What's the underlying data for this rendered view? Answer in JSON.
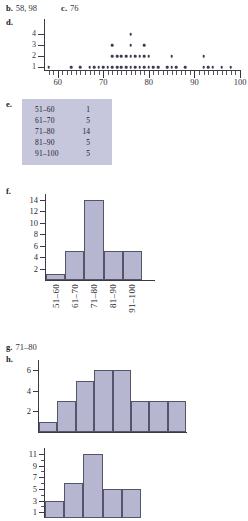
{
  "answers": {
    "b": {
      "label": "b.",
      "text": "58, 98"
    },
    "c": {
      "label": "c.",
      "text": "76"
    },
    "d": {
      "label": "d."
    },
    "e": {
      "label": "e."
    },
    "f": {
      "label": "f."
    },
    "g": {
      "label": "g.",
      "text": "71–80"
    },
    "h": {
      "label": "h."
    }
  },
  "frequency_table": {
    "rows": [
      {
        "interval": "51–60",
        "frequency": "1"
      },
      {
        "interval": "61–70",
        "frequency": "5"
      },
      {
        "interval": "71–80",
        "frequency": "14"
      },
      {
        "interval": "81–90",
        "frequency": "5"
      },
      {
        "interval": "91–100",
        "frequency": "5"
      }
    ],
    "background_color": "#c6c6dc"
  },
  "chart_data": [
    {
      "id": "dotplot_d",
      "type": "scatter",
      "title": "",
      "xlabel": "",
      "ylabel": "",
      "xlim": [
        57,
        100
      ],
      "ylim": [
        0,
        4
      ],
      "xtick_labels": [
        "60",
        "70",
        "80",
        "90",
        "100"
      ],
      "xticks": [
        60,
        70,
        80,
        90,
        100
      ],
      "ytick_labels": [
        "1",
        "2",
        "3",
        "4"
      ],
      "yticks": [
        1,
        2,
        3,
        4
      ],
      "grid": false,
      "note": "Dot plot: each dot is one observation stacked at its value",
      "x": [
        58,
        63,
        65,
        67,
        68,
        69,
        70,
        71,
        72,
        73,
        74,
        75,
        76,
        77,
        78,
        79,
        80,
        81,
        82,
        84,
        85,
        86,
        88,
        92,
        93,
        94,
        96,
        98
      ],
      "counts": [
        1,
        1,
        1,
        1,
        1,
        1,
        1,
        1,
        3,
        2,
        2,
        2,
        4,
        2,
        2,
        3,
        2,
        1,
        1,
        1,
        2,
        1,
        1,
        2,
        1,
        1,
        1,
        1
      ],
      "dots": [
        {
          "value": 58,
          "stack": 1
        },
        {
          "value": 63,
          "stack": 1
        },
        {
          "value": 65,
          "stack": 1
        },
        {
          "value": 67,
          "stack": 1
        },
        {
          "value": 68,
          "stack": 1
        },
        {
          "value": 69,
          "stack": 1
        },
        {
          "value": 70,
          "stack": 1
        },
        {
          "value": 71,
          "stack": 1
        },
        {
          "value": 72,
          "stack": 3
        },
        {
          "value": 73,
          "stack": 2
        },
        {
          "value": 74,
          "stack": 2
        },
        {
          "value": 75,
          "stack": 2
        },
        {
          "value": 76,
          "stack": 4
        },
        {
          "value": 77,
          "stack": 2
        },
        {
          "value": 78,
          "stack": 2
        },
        {
          "value": 79,
          "stack": 3
        },
        {
          "value": 80,
          "stack": 2
        },
        {
          "value": 81,
          "stack": 1
        },
        {
          "value": 82,
          "stack": 1
        },
        {
          "value": 84,
          "stack": 1
        },
        {
          "value": 85,
          "stack": 2
        },
        {
          "value": 86,
          "stack": 1
        },
        {
          "value": 88,
          "stack": 1
        },
        {
          "value": 92,
          "stack": 2
        },
        {
          "value": 93,
          "stack": 1
        },
        {
          "value": 94,
          "stack": 1
        },
        {
          "value": 96,
          "stack": 1
        },
        {
          "value": 98,
          "stack": 1
        }
      ]
    },
    {
      "id": "histogram_f",
      "type": "bar",
      "title": "",
      "xlabel": "",
      "ylabel": "",
      "categories": [
        "51–60",
        "61–70",
        "71–80",
        "81–90",
        "91–100"
      ],
      "values": [
        1,
        5,
        14,
        5,
        5
      ],
      "ylim": [
        0,
        15
      ],
      "ytick_labels": [
        "2",
        "4",
        "6",
        "8",
        "10",
        "12",
        "14"
      ],
      "yticks": [
        2,
        4,
        6,
        8,
        10,
        12,
        14
      ],
      "grid": false,
      "bar_color": "#b6b6d0",
      "bar_edge_color": "#55556a"
    },
    {
      "id": "histogram_h",
      "type": "bar",
      "title": "",
      "xlabel": "",
      "ylabel": "",
      "categories": [
        "1",
        "2",
        "3",
        "4",
        "5",
        "6",
        "7",
        "8"
      ],
      "values": [
        1,
        3,
        5,
        6,
        6,
        3,
        3,
        3
      ],
      "ylim": [
        0,
        7
      ],
      "ytick_labels": [
        "2",
        "4",
        "6"
      ],
      "yticks": [
        2,
        4,
        6
      ],
      "grid": false,
      "bar_color": "#b6b6d0",
      "bar_edge_color": "#55556a"
    },
    {
      "id": "histogram_bottom",
      "type": "bar",
      "title": "",
      "xlabel": "",
      "ylabel": "",
      "categories": [
        "1",
        "2",
        "3",
        "4",
        "5"
      ],
      "values": [
        3,
        6,
        11,
        5,
        5
      ],
      "ylim": [
        0,
        12
      ],
      "ytick_labels": [
        "1",
        "3",
        "5",
        "7",
        "9",
        "11"
      ],
      "yticks": [
        1,
        3,
        5,
        7,
        9,
        11
      ],
      "grid": false,
      "bar_color": "#b6b6d0",
      "bar_edge_color": "#55556a"
    }
  ]
}
